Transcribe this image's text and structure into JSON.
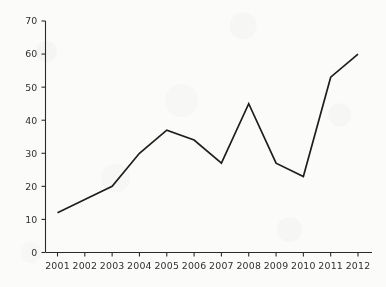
{
  "chart_data": {
    "type": "line",
    "title": "",
    "subtitle": "",
    "xlabel": "",
    "ylabel": "",
    "categories": [
      "2001",
      "2002",
      "2003",
      "2004",
      "2005",
      "2006",
      "2007",
      "2008",
      "2009",
      "2010",
      "2011",
      "2012"
    ],
    "x": [
      2001,
      2002,
      2003,
      2004,
      2005,
      2006,
      2007,
      2008,
      2009,
      2010,
      2011,
      2012
    ],
    "values": [
      12,
      16,
      20,
      30,
      37,
      34,
      27,
      45,
      27,
      23,
      53,
      60
    ],
    "series": [
      {
        "name": "",
        "values": [
          12,
          16,
          20,
          30,
          37,
          34,
          27,
          45,
          27,
          23,
          53,
          60
        ]
      }
    ],
    "xlim": [
      2001,
      2012
    ],
    "ylim": [
      0,
      70
    ],
    "yticks": [
      0,
      10,
      20,
      30,
      40,
      50,
      60,
      70
    ],
    "ytick_labels": [
      "0",
      "10",
      "20",
      "30",
      "40",
      "50",
      "60",
      "70"
    ],
    "xticks": [
      2001,
      2002,
      2003,
      2004,
      2005,
      2006,
      2007,
      2008,
      2009,
      2010,
      2011,
      2012
    ],
    "xtick_labels": [
      "2001",
      "2002",
      "2003",
      "2004",
      "2005",
      "2006",
      "2007",
      "2008",
      "2009",
      "2010",
      "2011",
      "2012"
    ],
    "grid": false,
    "legend": null,
    "legend_position": "none",
    "annotations": [],
    "line_color": "#1e1e1e",
    "axis_color": "#2b2b2b",
    "background_color": "#fbfbfa"
  }
}
